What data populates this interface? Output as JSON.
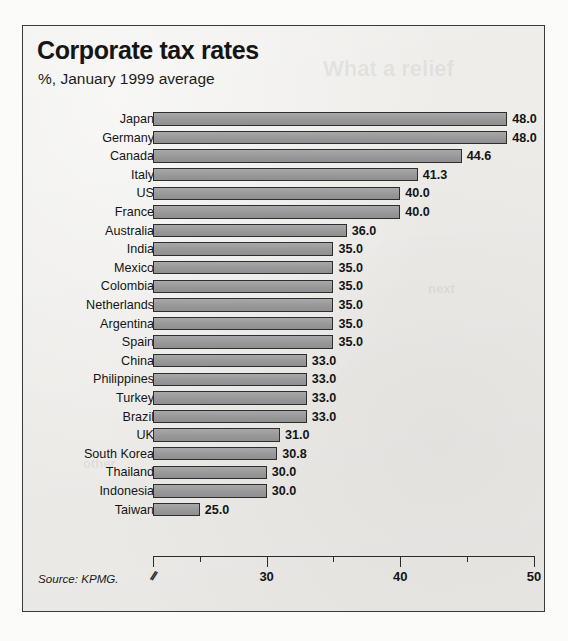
{
  "figure": {
    "title": "Corporate tax rates",
    "subtitle": "%, January 1999 average",
    "source": "Source: KPMG.",
    "bleed_text": {
      "top": "What a relief",
      "mid": "next",
      "low": "other"
    }
  },
  "chart_data": {
    "type": "bar",
    "orientation": "horizontal",
    "title": "Corporate tax rates",
    "subtitle": "%, January 1999 average",
    "xlabel": "",
    "ylabel": "",
    "xlim": [
      21.5,
      50
    ],
    "axis_break": true,
    "grid": false,
    "legend": null,
    "bar_color": "#9d9d9d",
    "bar_edge_color": "#2e2e2e",
    "xticks": [
      25,
      30,
      35,
      40,
      45,
      50
    ],
    "xtick_labels": [
      "",
      "30",
      "",
      "40",
      "",
      "50"
    ],
    "xtick_major": [
      30,
      40,
      50
    ],
    "categories": [
      "Japan",
      "Germany",
      "Canada",
      "Italy",
      "US",
      "France",
      "Australia",
      "India",
      "Mexico",
      "Colombia",
      "Netherlands",
      "Argentina",
      "Spain",
      "China",
      "Philippines",
      "Turkey",
      "Brazil",
      "UK",
      "South Korea",
      "Thailand",
      "Indonesia",
      "Taiwan"
    ],
    "values": [
      48.0,
      48.0,
      44.6,
      41.3,
      40.0,
      40.0,
      36.0,
      35.0,
      35.0,
      35.0,
      35.0,
      35.0,
      35.0,
      33.0,
      33.0,
      33.0,
      33.0,
      31.0,
      30.8,
      30.0,
      30.0,
      25.0
    ],
    "value_labels": [
      "48.0",
      "48.0",
      "44.6",
      "41.3",
      "40.0",
      "40.0",
      "36.0",
      "35.0",
      "35.0",
      "35.0",
      "35.0",
      "35.0",
      "35.0",
      "33.0",
      "33.0",
      "33.0",
      "33.0",
      "31.0",
      "30.8",
      "30.0",
      "30.0",
      "25.0"
    ]
  }
}
